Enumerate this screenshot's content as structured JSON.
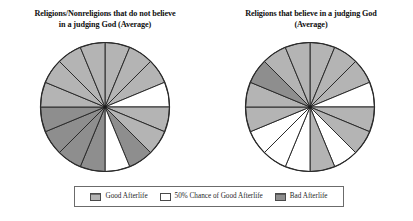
{
  "figure": {
    "background": "#ffffff",
    "charts": [
      {
        "id": "left",
        "title_line1": "Religions/Nonreligions that do not believe",
        "title_line2": "in a judging God (Average)"
      },
      {
        "id": "right",
        "title_line1": "Religions that believe in a judging God",
        "title_line2": "(Average)"
      }
    ]
  },
  "legend": {
    "items": [
      {
        "label": "Good Afterlife",
        "swatch": "good-afterlife-swatch",
        "color": "#b4b4b4"
      },
      {
        "label": "50% Chance of Good Afterlife",
        "swatch": "half-chance-swatch",
        "color": "#ffffff"
      },
      {
        "label": "Bad Afterlife",
        "swatch": "bad-afterlife-swatch",
        "color": "#8e8e8e"
      }
    ]
  },
  "chart_data": [
    {
      "type": "pie",
      "id": "left-pie",
      "title": "Religions/Nonreligions that do not believe in a judging God (Average)",
      "legend_position": "bottom-shared",
      "slice_count": 16,
      "equal_slices": true,
      "slice_angle_degrees": 22.5,
      "categories": [
        "Good Afterlife",
        "50% Chance of Good Afterlife",
        "Bad Afterlife"
      ],
      "colors": {
        "Good Afterlife": "#b4b4b4",
        "50% Chance of Good Afterlife": "#ffffff",
        "Bad Afterlife": "#8e8e8e"
      },
      "values": [
        9,
        2,
        5
      ],
      "percentages": [
        56.25,
        12.5,
        31.25
      ],
      "slices": [
        "Good Afterlife",
        "Good Afterlife",
        "Good Afterlife",
        "50% Chance of Good Afterlife",
        "Good Afterlife",
        "Good Afterlife",
        "Bad Afterlife",
        "50% Chance of Good Afterlife",
        "Bad Afterlife",
        "Bad Afterlife",
        "Bad Afterlife",
        "Bad Afterlife",
        "Good Afterlife",
        "Good Afterlife",
        "Good Afterlife",
        "Good Afterlife"
      ]
    },
    {
      "type": "pie",
      "id": "right-pie",
      "title": "Religions that believe in a judging God (Average)",
      "legend_position": "bottom-shared",
      "slice_count": 16,
      "equal_slices": true,
      "slice_angle_degrees": 22.5,
      "categories": [
        "Good Afterlife",
        "50% Chance of Good Afterlife",
        "Bad Afterlife"
      ],
      "colors": {
        "Good Afterlife": "#b4b4b4",
        "50% Chance of Good Afterlife": "#ffffff",
        "Bad Afterlife": "#8e8e8e"
      },
      "values": [
        9,
        5,
        2
      ],
      "percentages": [
        56.25,
        31.25,
        12.5
      ],
      "slices": [
        "Good Afterlife",
        "Good Afterlife",
        "Good Afterlife",
        "50% Chance of Good Afterlife",
        "Good Afterlife",
        "Good Afterlife",
        "50% Chance of Good Afterlife",
        "Good Afterlife",
        "50% Chance of Good Afterlife",
        "50% Chance of Good Afterlife",
        "50% Chance of Good Afterlife",
        "Good Afterlife",
        "Good Afterlife",
        "Bad Afterlife",
        "Good Afterlife",
        "Good Afterlife"
      ]
    }
  ]
}
